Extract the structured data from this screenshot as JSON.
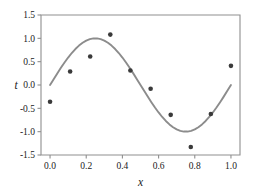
{
  "chart_data": {
    "type": "scatter",
    "title": "",
    "xlabel": "x",
    "ylabel": "t",
    "xlim": [
      -0.05,
      1.05
    ],
    "ylim": [
      -1.5,
      1.5
    ],
    "grid": false,
    "legend": null,
    "xticks": [
      0.0,
      0.2,
      0.4,
      0.6,
      0.8,
      1.0
    ],
    "xtick_labels": [
      "0.0",
      "0.2",
      "0.4",
      "0.6",
      "0.8",
      "1.0"
    ],
    "yticks": [
      -1.5,
      -1.0,
      -0.5,
      0.0,
      0.5,
      1.0,
      1.5
    ],
    "ytick_labels": [
      "-1.5",
      "-1.0",
      "-0.5",
      "0.0",
      "0.5",
      "1.0",
      "1.5"
    ],
    "series": [
      {
        "name": "data points",
        "type": "scatter",
        "marker": "circle",
        "color": "#3a3a3a",
        "x": [
          0.0,
          0.111,
          0.222,
          0.333,
          0.444,
          0.556,
          0.667,
          0.778,
          0.889,
          1.0
        ],
        "y": [
          -0.36,
          0.29,
          0.61,
          1.08,
          0.31,
          -0.08,
          -0.64,
          -1.33,
          -0.62,
          0.41
        ]
      },
      {
        "name": "sin(2*pi*x)",
        "type": "line",
        "color": "#8c8c8c",
        "x": [
          0.0,
          0.02,
          0.04,
          0.06,
          0.08,
          0.1,
          0.12,
          0.14,
          0.16,
          0.18,
          0.2,
          0.22,
          0.24,
          0.26,
          0.28,
          0.3,
          0.32,
          0.34,
          0.36,
          0.38,
          0.4,
          0.42,
          0.44,
          0.46,
          0.48,
          0.5,
          0.52,
          0.54,
          0.56,
          0.58,
          0.6,
          0.62,
          0.64,
          0.66,
          0.68,
          0.7,
          0.72,
          0.74,
          0.76,
          0.78,
          0.8,
          0.82,
          0.84,
          0.86,
          0.88,
          0.9,
          0.92,
          0.94,
          0.96,
          0.98,
          1.0
        ],
        "y": [
          0.0,
          0.125,
          0.249,
          0.368,
          0.482,
          0.588,
          0.685,
          0.771,
          0.844,
          0.904,
          0.951,
          0.982,
          0.998,
          0.998,
          0.982,
          0.951,
          0.905,
          0.844,
          0.771,
          0.685,
          0.588,
          0.482,
          0.368,
          0.249,
          0.125,
          0.0,
          -0.125,
          -0.249,
          -0.368,
          -0.482,
          -0.588,
          -0.685,
          -0.771,
          -0.844,
          -0.905,
          -0.951,
          -0.982,
          -0.998,
          -0.998,
          -0.982,
          -0.951,
          -0.904,
          -0.844,
          -0.771,
          -0.685,
          -0.588,
          -0.482,
          -0.368,
          -0.249,
          -0.125,
          0.0
        ]
      }
    ]
  },
  "colors": {
    "curve": "#8c8c8c",
    "points": "#3a3a3a",
    "axis": "#8f8f8f",
    "text": "#1a1a1a",
    "background": "#ffffff"
  }
}
